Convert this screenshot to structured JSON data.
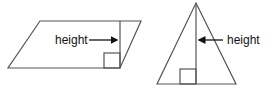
{
  "diagram": {
    "stroke_color": "#555555",
    "text_color": "#111111",
    "parallelogram": {
      "label": "height",
      "points": [
        [
          40,
          21
        ],
        [
          141,
          21
        ],
        [
          120,
          68
        ],
        [
          8,
          68
        ]
      ],
      "height_line": {
        "x": 120,
        "y1": 21,
        "y2": 68
      },
      "right_angle_box": {
        "x": 104,
        "y": 53,
        "size": 16
      },
      "arrow": {
        "x1": 89,
        "x2": 118,
        "y": 40
      },
      "label_pos": {
        "x": 55,
        "y": 44
      }
    },
    "triangle": {
      "label": "height",
      "points": [
        [
          196,
          3
        ],
        [
          236,
          84
        ],
        [
          157,
          84
        ]
      ],
      "height_line": {
        "x": 196,
        "y1": 3,
        "y2": 84
      },
      "right_angle_box": {
        "x": 180,
        "y": 69,
        "size": 15
      },
      "arrow": {
        "x1": 223,
        "x2": 198,
        "y": 40
      },
      "label_pos": {
        "x": 228,
        "y": 44
      }
    }
  }
}
